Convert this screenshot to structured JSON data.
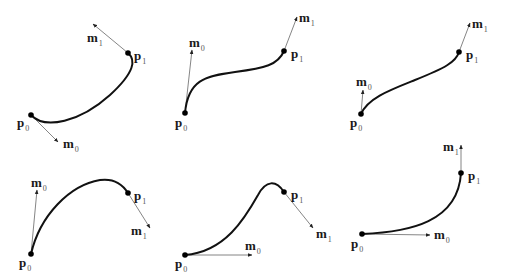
{
  "figure": {
    "panels": [
      {
        "id": "panel-1",
        "p0": {
          "x": 31,
          "y": 115
        },
        "p1": {
          "x": 128,
          "y": 53
        },
        "m0_tip": {
          "x": 58,
          "y": 142
        },
        "m1_tip": {
          "x": 93,
          "y": 24
        },
        "path": "M31,115 C45,130 80,122 110,95 C135,72 136,60 128,53",
        "labels": {
          "p0": {
            "text": "p",
            "sub": "0",
            "x": 17,
            "y": 127
          },
          "p1": {
            "text": "p",
            "sub": "1",
            "x": 134,
            "y": 60
          },
          "m0": {
            "text": "m",
            "sub": "0",
            "x": 63,
            "y": 148
          },
          "m1": {
            "text": "m",
            "sub": "1",
            "x": 87,
            "y": 42
          }
        }
      },
      {
        "id": "panel-2",
        "p0": {
          "x": 185,
          "y": 113
        },
        "p1": {
          "x": 284,
          "y": 51
        },
        "m0_tip": {
          "x": 192,
          "y": 50
        },
        "m1_tip": {
          "x": 297,
          "y": 17
        },
        "path": "M185,113 C188,80 205,76 235,72 C265,68 278,65 284,51",
        "labels": {
          "p0": {
            "text": "p",
            "sub": "0",
            "x": 175,
            "y": 127
          },
          "p1": {
            "text": "p",
            "sub": "1",
            "x": 291,
            "y": 58
          },
          "m0": {
            "text": "m",
            "sub": "0",
            "x": 189,
            "y": 47
          },
          "m1": {
            "text": "m",
            "sub": "1",
            "x": 299,
            "y": 22
          }
        }
      },
      {
        "id": "panel-3",
        "p0": {
          "x": 361,
          "y": 114
        },
        "p1": {
          "x": 459,
          "y": 52
        },
        "m0_tip": {
          "x": 363,
          "y": 90
        },
        "m1_tip": {
          "x": 470,
          "y": 23
        },
        "path": "M361,114 C368,98 390,90 415,80 C445,68 456,62 459,52",
        "labels": {
          "p0": {
            "text": "p",
            "sub": "0",
            "x": 350,
            "y": 127
          },
          "p1": {
            "text": "p",
            "sub": "1",
            "x": 466,
            "y": 59
          },
          "m0": {
            "text": "m",
            "sub": "0",
            "x": 356,
            "y": 86
          },
          "m1": {
            "text": "m",
            "sub": "1",
            "x": 472,
            "y": 28
          }
        }
      },
      {
        "id": "panel-4",
        "p0": {
          "x": 31,
          "y": 254
        },
        "p1": {
          "x": 128,
          "y": 193
        },
        "m0_tip": {
          "x": 37,
          "y": 190
        },
        "m1_tip": {
          "x": 150,
          "y": 228
        },
        "path": "M31,254 C40,215 70,185 100,180 C115,178 123,185 128,193",
        "labels": {
          "p0": {
            "text": "p",
            "sub": "0",
            "x": 19,
            "y": 267
          },
          "p1": {
            "text": "p",
            "sub": "1",
            "x": 134,
            "y": 200
          },
          "m0": {
            "text": "m",
            "sub": "0",
            "x": 31,
            "y": 187
          },
          "m1": {
            "text": "m",
            "sub": "1",
            "x": 131,
            "y": 235
          }
        }
      },
      {
        "id": "panel-5",
        "p0": {
          "x": 185,
          "y": 255
        },
        "p1": {
          "x": 284,
          "y": 192
        },
        "m0_tip": {
          "x": 252,
          "y": 255
        },
        "m1_tip": {
          "x": 313,
          "y": 228
        },
        "path": "M185,255 C225,252 245,218 258,195 C266,180 276,180 284,192",
        "labels": {
          "p0": {
            "text": "p",
            "sub": "0",
            "x": 175,
            "y": 268
          },
          "p1": {
            "text": "p",
            "sub": "1",
            "x": 291,
            "y": 199
          },
          "m0": {
            "text": "m",
            "sub": "0",
            "x": 245,
            "y": 250
          },
          "m1": {
            "text": "m",
            "sub": "1",
            "x": 316,
            "y": 238
          }
        }
      },
      {
        "id": "panel-6",
        "p0": {
          "x": 362,
          "y": 234
        },
        "p1": {
          "x": 461,
          "y": 173
        },
        "m0_tip": {
          "x": 430,
          "y": 235
        },
        "m1_tip": {
          "x": 461,
          "y": 145
        },
        "path": "M362,234 C410,232 458,222 461,173",
        "labels": {
          "p0": {
            "text": "p",
            "sub": "0",
            "x": 351,
            "y": 248
          },
          "p1": {
            "text": "p",
            "sub": "1",
            "x": 468,
            "y": 180
          },
          "m0": {
            "text": "m",
            "sub": "0",
            "x": 434,
            "y": 239
          },
          "m1": {
            "text": "m",
            "sub": "1",
            "x": 443,
            "y": 151
          }
        }
      }
    ]
  }
}
